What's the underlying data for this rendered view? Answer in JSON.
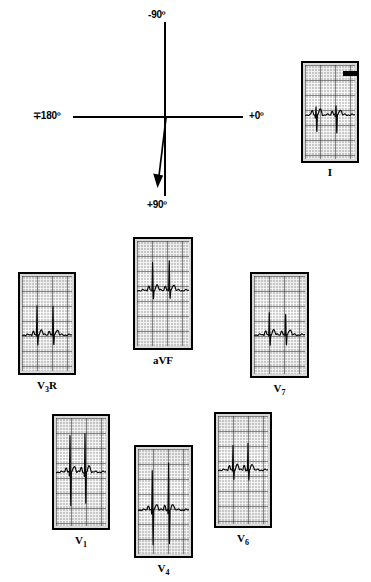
{
  "figure": {
    "type": "ecg-vector-diagram",
    "background_color": "#ffffff",
    "line_color": "#000000",
    "grid_color": "#cfcfcf"
  },
  "vector_diagram": {
    "name": "hexaxial-reference-axis",
    "origin": {
      "x": 165,
      "y": 117
    },
    "axes": [
      {
        "name": "vertical-axis",
        "from": {
          "x": 165,
          "y": 22
        },
        "to": {
          "x": 165,
          "y": 196
        }
      },
      {
        "name": "horizontal-axis",
        "from": {
          "x": 73,
          "y": 117
        },
        "to": {
          "x": 243,
          "y": 117
        }
      }
    ],
    "labels": {
      "top": "-90º",
      "left": "∓180º",
      "right": "+0º",
      "bottom": "+90º"
    },
    "mean_axis_vector": {
      "name": "mean-qrs-axis-arrow",
      "from": {
        "x": 166,
        "y": 118
      },
      "to": {
        "x": 157,
        "y": 186
      },
      "approx_degrees": "+97"
    }
  },
  "ecg_strips": [
    {
      "id": "lead-I",
      "label": "I",
      "label_html": "I",
      "x": 301,
      "y": 61,
      "w": 58,
      "h": 102,
      "label_x": 301,
      "label_y": 166,
      "label_w": 58,
      "has_calibration_mark": true,
      "calibration_mark": {
        "x": 38,
        "y": 6,
        "w": 14,
        "h": 5
      },
      "trace": {
        "baseline": 0.53,
        "qrs_polarity": "biphasic-small",
        "beats": [
          {
            "r_x": 0.22,
            "r_amp": 0.1,
            "s_amp": 0.2
          },
          {
            "r_x": 0.62,
            "r_amp": 0.1,
            "s_amp": 0.22
          }
        ]
      }
    },
    {
      "id": "lead-V3R",
      "label": "V3R",
      "label_html": "V<sub>3</sub>R",
      "x": 18,
      "y": 272,
      "w": 58,
      "h": 103,
      "label_x": 18,
      "label_y": 379,
      "label_w": 58,
      "has_calibration_mark": false,
      "trace": {
        "baseline": 0.62,
        "qrs_polarity": "positive-rS",
        "beats": [
          {
            "r_x": 0.3,
            "r_amp": 0.3,
            "s_amp": 0.12
          },
          {
            "r_x": 0.62,
            "r_amp": 0.32,
            "s_amp": 0.12
          }
        ]
      }
    },
    {
      "id": "lead-aVF",
      "label": "aVF",
      "label_html": "aVF",
      "x": 133,
      "y": 237,
      "w": 60,
      "h": 113,
      "label_x": 133,
      "label_y": 354,
      "label_w": 60,
      "has_calibration_mark": false,
      "trace": {
        "baseline": 0.47,
        "qrs_polarity": "positive-tall-R",
        "beats": [
          {
            "r_x": 0.3,
            "r_amp": 0.26,
            "s_amp": 0.09
          },
          {
            "r_x": 0.62,
            "r_amp": 0.3,
            "s_amp": 0.09
          }
        ]
      }
    },
    {
      "id": "lead-V7",
      "label": "V7",
      "label_html": "V<sub>7</sub>",
      "x": 250,
      "y": 272,
      "w": 59,
      "h": 106,
      "label_x": 250,
      "label_y": 382,
      "label_w": 59,
      "has_calibration_mark": false,
      "trace": {
        "baseline": 0.6,
        "qrs_polarity": "small-rS",
        "beats": [
          {
            "r_x": 0.3,
            "r_amp": 0.22,
            "s_amp": 0.12
          },
          {
            "r_x": 0.62,
            "r_amp": 0.22,
            "s_amp": 0.12
          }
        ]
      }
    },
    {
      "id": "lead-V1",
      "label": "V1",
      "label_html": "V<sub>1</sub>",
      "x": 52,
      "y": 414,
      "w": 58,
      "h": 116,
      "label_x": 52,
      "label_y": 534,
      "label_w": 58,
      "has_calibration_mark": false,
      "trace": {
        "baseline": 0.5,
        "qrs_polarity": "deep-QS",
        "beats": [
          {
            "r_x": 0.28,
            "r_amp": 0.36,
            "s_amp": 0.32
          },
          {
            "r_x": 0.58,
            "r_amp": 0.38,
            "s_amp": 0.3
          }
        ]
      }
    },
    {
      "id": "lead-V4",
      "label": "V4",
      "label_html": "V<sub>4</sub>",
      "x": 134,
      "y": 445,
      "w": 59,
      "h": 113,
      "label_x": 134,
      "label_y": 562,
      "label_w": 59,
      "has_calibration_mark": false,
      "trace": {
        "baseline": 0.58,
        "qrs_polarity": "deep-S",
        "beats": [
          {
            "r_x": 0.28,
            "r_amp": 0.4,
            "s_amp": 0.34
          },
          {
            "r_x": 0.6,
            "r_amp": 0.44,
            "s_amp": 0.34
          }
        ]
      }
    },
    {
      "id": "lead-V6",
      "label": "V6",
      "label_html": "V<sub>6</sub>",
      "x": 214,
      "y": 412,
      "w": 58,
      "h": 116,
      "label_x": 214,
      "label_y": 532,
      "label_w": 58,
      "has_calibration_mark": false,
      "trace": {
        "baseline": 0.5,
        "qrs_polarity": "small-R",
        "beats": [
          {
            "r_x": 0.3,
            "r_amp": 0.22,
            "s_amp": 0.1
          },
          {
            "r_x": 0.6,
            "r_amp": 0.24,
            "s_amp": 0.1
          }
        ]
      }
    }
  ]
}
